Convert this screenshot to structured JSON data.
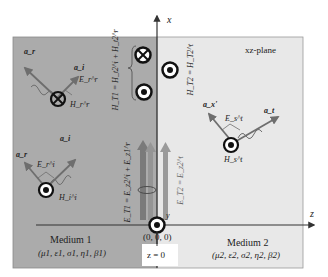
{
  "diagram": {
    "plane_label": "xz-plane",
    "axes": {
      "x_label": "x",
      "z_label": "z",
      "y_label": "y",
      "origin_label": "(0, 0, 0)",
      "boundary_label": "z = 0"
    },
    "medium1": {
      "title": "Medium 1",
      "params": "(μ1, ε1, σ1, η1, β1)",
      "color": "#ababab"
    },
    "medium2": {
      "title": "Medium 2",
      "params": "(μ2, ε2, σ2, η2, β2)",
      "color": "#e8e8e8"
    },
    "top_left_wave": {
      "a_r": "a_r",
      "a_i": "a_i",
      "E": "E_r^r",
      "H": "H_r^r",
      "h_symbol": "into-page (⊗)"
    },
    "bottom_left_wave": {
      "a_r": "a_r",
      "a_i": "a_i",
      "E": "E_r^i",
      "H": "H_i^i",
      "h_symbol": "out-of-page (⊙)"
    },
    "right_wave": {
      "a_t": "a_t",
      "a_x": "a_x'",
      "E": "E_s^t",
      "H": "H_s^t",
      "h_symbol": "out-of-page (⊙)"
    },
    "equations": {
      "h_t1": "H_T1 = H_t2^i + H_t2^r",
      "h_t2": "H_T2 = H_T2^t",
      "e_t1": "E_T1 = E_z2^i + E_z1^r",
      "e_t2": "E_T2 = E_z2^t"
    },
    "colors": {
      "arrow_gray": "#6e6e6e",
      "axis": "#333333",
      "bar_dark": "#7a7a7a",
      "bar_mid": "#8e8e8e"
    }
  }
}
